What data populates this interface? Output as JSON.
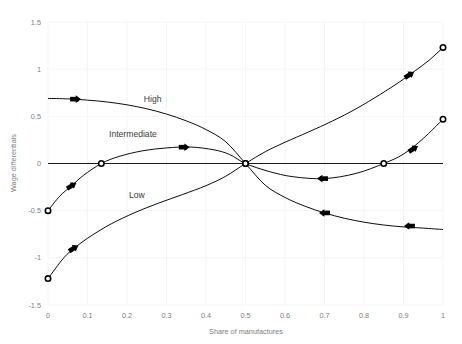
{
  "chart_data": {
    "type": "line",
    "title": "",
    "xlabel": "Share of manufactures",
    "ylabel": "Wage differentials",
    "xlim": [
      0,
      1
    ],
    "ylim": [
      -1.5,
      1.5
    ],
    "xticks": [
      "0",
      "0.1",
      "0.2",
      "0.3",
      "0.4",
      "0.5",
      "0.6",
      "0.7",
      "0.8",
      "0.9",
      "1"
    ],
    "xtick_values": [
      0,
      0.1,
      0.2,
      0.3,
      0.4,
      0.5,
      0.6,
      0.7,
      0.8,
      0.9,
      1
    ],
    "yticks": [
      "1.5",
      "1",
      "0.5",
      "0",
      "-0.5",
      "-1",
      "-1.5"
    ],
    "ytick_values": [
      1.5,
      1,
      0.5,
      0,
      -0.5,
      -1,
      -1.5
    ],
    "grid": true,
    "legend": "inline-annotations",
    "zero_line": 0,
    "annotations": [
      {
        "text": "High",
        "x": 0.265,
        "y": 0.655
      },
      {
        "text": "Intermediate",
        "x": 0.215,
        "y": 0.285
      },
      {
        "text": "Low",
        "x": 0.225,
        "y": -0.37
      }
    ],
    "series": [
      {
        "name": "High",
        "comment": "starts at (0, 0.69), falls through (0.5, 0) to (1, -0.70)",
        "x": [
          0,
          0.05,
          0.1,
          0.15,
          0.2,
          0.25,
          0.3,
          0.35,
          0.4,
          0.45,
          0.5,
          0.55,
          0.6,
          0.65,
          0.7,
          0.75,
          0.8,
          0.85,
          0.9,
          0.95,
          1
        ],
        "y": [
          0.69,
          0.685,
          0.672,
          0.652,
          0.622,
          0.58,
          0.524,
          0.452,
          0.36,
          0.23,
          0.0,
          -0.23,
          -0.36,
          -0.452,
          -0.524,
          -0.58,
          -0.622,
          -0.652,
          -0.672,
          -0.685,
          -0.7
        ],
        "endpoints": [
          {
            "x": 0,
            "y": 0.69,
            "marker": "none"
          },
          {
            "x": 1,
            "y": -0.7,
            "marker": "none"
          }
        ],
        "arrows": [
          {
            "x": 0.07,
            "y": 0.682,
            "dir": "right"
          },
          {
            "x": 0.7,
            "y": -0.524,
            "dir": "left"
          },
          {
            "x": 0.915,
            "y": -0.663,
            "dir": "left"
          }
        ]
      },
      {
        "name": "Intermediate",
        "comment": "starts at (0, -0.50), rises through zero at 0.135, peak ~0.175 near 0.36, back to 0 at 0.5, dips to min ~-0.16 near 0.70, crosses zero at 0.85, ends at (1, 0.47)",
        "x": [
          0,
          0.03,
          0.06,
          0.09,
          0.135,
          0.18,
          0.24,
          0.3,
          0.36,
          0.42,
          0.46,
          0.5,
          0.56,
          0.62,
          0.7,
          0.78,
          0.85,
          0.9,
          0.95,
          1
        ],
        "y": [
          -0.5,
          -0.345,
          -0.235,
          -0.125,
          0.0,
          0.075,
          0.135,
          0.165,
          0.175,
          0.145,
          0.095,
          0.0,
          -0.085,
          -0.14,
          -0.16,
          -0.105,
          0.0,
          0.1,
          0.265,
          0.47
        ],
        "endpoints": [
          {
            "x": 0,
            "y": -0.5,
            "marker": "open-circle"
          },
          {
            "x": 1,
            "y": 0.47,
            "marker": "open-circle"
          }
        ],
        "zero_crossings": [
          {
            "x": 0.135,
            "y": 0
          },
          {
            "x": 0.5,
            "y": 0
          },
          {
            "x": 0.85,
            "y": 0
          }
        ],
        "arrows": [
          {
            "x": 0.06,
            "y": -0.235,
            "dir": "right-up"
          },
          {
            "x": 0.345,
            "y": 0.173,
            "dir": "right"
          },
          {
            "x": 0.695,
            "y": -0.16,
            "dir": "left"
          },
          {
            "x": 0.925,
            "y": 0.155,
            "dir": "right-up"
          }
        ]
      },
      {
        "name": "Low",
        "comment": "starts at (0, -1.22), rises steeply through (0.5, 0) and on up to (1, 1.23)",
        "x": [
          0,
          0.04,
          0.07,
          0.11,
          0.16,
          0.22,
          0.28,
          0.34,
          0.4,
          0.45,
          0.5,
          0.55,
          0.6,
          0.66,
          0.72,
          0.78,
          0.84,
          0.89,
          0.93,
          0.965,
          1
        ],
        "y": [
          -1.22,
          -1.0,
          -0.885,
          -0.765,
          -0.64,
          -0.52,
          -0.42,
          -0.33,
          -0.235,
          -0.135,
          0.0,
          0.125,
          0.225,
          0.335,
          0.45,
          0.58,
          0.73,
          0.865,
          0.985,
          1.095,
          1.23
        ],
        "endpoints": [
          {
            "x": 0,
            "y": -1.22,
            "marker": "open-circle"
          },
          {
            "x": 1,
            "y": 1.23,
            "marker": "open-circle"
          }
        ],
        "zero_crossings": [
          {
            "x": 0.5,
            "y": 0
          }
        ],
        "arrows": [
          {
            "x": 0.065,
            "y": -0.9,
            "dir": "right-up"
          },
          {
            "x": 0.915,
            "y": 0.94,
            "dir": "right-up"
          }
        ]
      }
    ],
    "colors": {
      "curve": "#000000",
      "grid": "#f2f2f2",
      "axis_text": "#808080",
      "label_text": "#3b3b3b",
      "background": "#ffffff"
    }
  }
}
